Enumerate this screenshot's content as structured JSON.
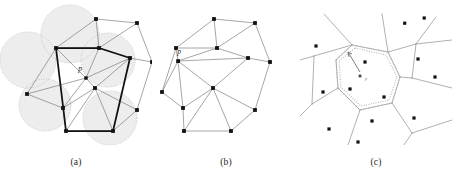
{
  "figure": {
    "background_color": "#ffffff"
  },
  "colors": {
    "edge": "#6e6e6e",
    "bold_edge": "#111111",
    "vertex": "#111111",
    "circle_fill": "#ededed",
    "dotted": "#b9b9b9",
    "dotted_dark": "#9a9a9a",
    "voronoi_edge": "#8a8a8a",
    "site": "#111111",
    "caption": "#262626",
    "label": "#1a1a1a"
  },
  "panels": [
    {
      "id": "a",
      "caption": "(a)",
      "point_label": "p",
      "description": "Triangulation with circumcircles of triangles containing p shaded; the bold polygon is the cavity boundary",
      "vertices": [
        [
          96,
          19
        ],
        [
          137,
          23
        ],
        [
          99,
          48
        ],
        [
          56,
          48
        ],
        [
          27,
          94
        ],
        [
          63,
          108
        ],
        [
          95,
          88
        ],
        [
          130,
          58
        ],
        [
          152,
          62
        ],
        [
          137,
          110
        ],
        [
          113,
          131
        ],
        [
          66,
          131
        ]
      ],
      "insert_point": [
        86,
        78
      ],
      "cavity_polygon": [
        [
          56,
          48
        ],
        [
          99,
          48
        ],
        [
          130,
          58
        ],
        [
          113,
          131
        ],
        [
          66,
          131
        ]
      ],
      "circumcircles": [
        {
          "cx": 70,
          "cy": 34,
          "r": 29
        },
        {
          "cx": 28,
          "cy": 60,
          "r": 28
        },
        {
          "cx": 45,
          "cy": 105,
          "r": 26
        },
        {
          "cx": 108,
          "cy": 60,
          "r": 27
        },
        {
          "cx": 110,
          "cy": 118,
          "r": 27
        }
      ]
    },
    {
      "id": "b",
      "caption": "(b)",
      "point_label": "p",
      "description": "Cavity retriangulated by joining p to every vertex of the cavity boundary",
      "vertices": [
        [
          62,
          19
        ],
        [
          103,
          23
        ],
        [
          65,
          48
        ],
        [
          24,
          48
        ],
        [
          10,
          92
        ],
        [
          31,
          108
        ],
        [
          61,
          88
        ],
        [
          96,
          58
        ],
        [
          118,
          62
        ],
        [
          103,
          110
        ],
        [
          79,
          131
        ],
        [
          32,
          131
        ]
      ],
      "insert_point": [
        26,
        61
      ]
    },
    {
      "id": "c",
      "caption": "(c)",
      "point_label": "p",
      "description": "Voronoi diagram; the dotted polygon is the new cell of the inserted site p",
      "sites": [
        [
          65,
          62
        ],
        [
          104,
          23
        ],
        [
          124,
          18
        ],
        [
          118,
          59
        ],
        [
          135,
          77
        ],
        [
          23,
          92
        ],
        [
          50,
          89
        ],
        [
          84,
          97
        ],
        [
          72,
          121
        ],
        [
          29,
          129
        ],
        [
          114,
          118
        ],
        [
          58,
          142
        ]
      ],
      "new_site": [
        58,
        76
      ],
      "new_cell": [
        [
          52,
          45
        ],
        [
          88,
          52
        ],
        [
          100,
          77
        ],
        [
          92,
          103
        ],
        [
          60,
          110
        ],
        [
          38,
          88
        ],
        [
          36,
          60
        ]
      ]
    }
  ]
}
